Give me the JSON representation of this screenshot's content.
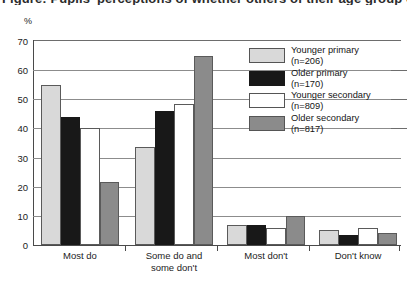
{
  "title_fragment": "Figure: Pupils' perceptions of whether others of their age group comply",
  "axis_unit": "%",
  "chart_data": {
    "type": "bar",
    "title": "",
    "xlabel": "",
    "ylabel": "%",
    "ylim": [
      0,
      70
    ],
    "ytick_step": 10,
    "yticks": [
      "0",
      "10",
      "20",
      "30",
      "40",
      "50",
      "60",
      "70"
    ],
    "grid": true,
    "legend_position": "inside-right",
    "categories": [
      "Most do",
      "Some do and\nsome don't",
      "Most don't",
      "Don't know"
    ],
    "series": [
      {
        "name": "Younger primary",
        "n": "206",
        "legend_n": "(n=206)",
        "color": "#d9d9d9",
        "values": [
          55,
          33.5,
          7,
          5
        ]
      },
      {
        "name": "Older primary",
        "n": "170",
        "legend_n": "(n=170)",
        "color": "#181818",
        "values": [
          44,
          46,
          7,
          3.5
        ]
      },
      {
        "name": "Younger secondary",
        "n": "809",
        "legend_n": "(n=809)",
        "color": "#ffffff",
        "values": [
          40,
          48.5,
          6,
          6
        ]
      },
      {
        "name": "Older secondary",
        "n": "817",
        "legend_n": "(n=817)",
        "color": "#8b8b8b",
        "values": [
          21.5,
          65,
          10,
          4
        ]
      }
    ]
  },
  "legend": {
    "items": [
      {
        "label": "Younger primary",
        "sub": "(n=206)"
      },
      {
        "label": "Older primary",
        "sub": "(n=170)"
      },
      {
        "label": "Younger secondary",
        "sub": "(n=809)"
      },
      {
        "label": "Older secondary",
        "sub": "(n=817)"
      }
    ]
  }
}
